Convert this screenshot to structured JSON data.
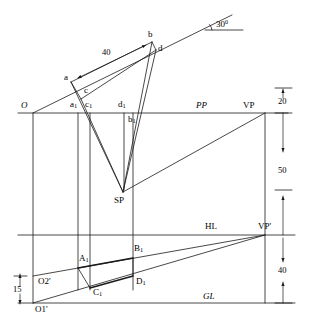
{
  "figure": {
    "angle_label": "30",
    "angle_unit": "0",
    "stroke_color": "#1a1a1a",
    "background": "#ffffff"
  },
  "reference_lines": [
    {
      "name": "PP",
      "label": "PP"
    },
    {
      "name": "HL",
      "label": "HL"
    },
    {
      "name": "GL",
      "label": "GL"
    }
  ],
  "points": {
    "O": "O",
    "a": "a",
    "b": "b",
    "c": "c",
    "d": "d",
    "a1": "a",
    "a1_sub": "1",
    "b1": "b",
    "b1_sub": "1",
    "c1": "c",
    "c1_sub": "1",
    "d1": "d",
    "d1_sub": "1",
    "SP": "SP",
    "VP": "VP",
    "VPp": "VP'",
    "A1": "A",
    "A1_sub": "1",
    "B1": "B",
    "B1_sub": "1",
    "C1": "C",
    "C1_sub": "1",
    "D1": "D",
    "D1_sub": "1",
    "O1p": "O1'",
    "O2p": "O2'"
  },
  "dimensions": {
    "plan_length": "40",
    "top_offset": "20",
    "pp_to_hl": "50",
    "hl_to_gl": "40",
    "ground_offset": "15"
  }
}
